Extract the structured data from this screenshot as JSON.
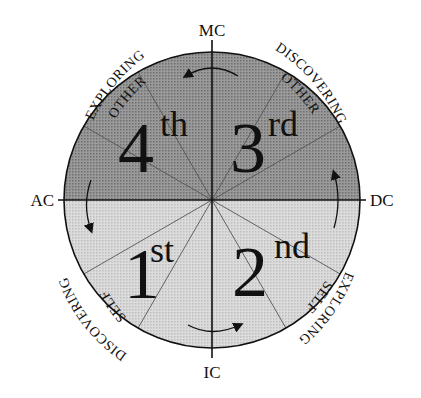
{
  "diagram": {
    "type": "quadrant-wheel",
    "center": {
      "x": 212,
      "y": 200
    },
    "radius": 148,
    "colors": {
      "upper_fill": "#8e8e8e",
      "lower_fill": "#d4d4d4",
      "lines": "#111111",
      "house_lines": "#555555"
    },
    "axis_labels": {
      "top": "MC",
      "bottom": "IC",
      "left": "AC",
      "right": "DC"
    },
    "quadrants": [
      {
        "number": "1",
        "suffix": "st",
        "position": "lower-left"
      },
      {
        "number": "2",
        "suffix": "nd",
        "position": "lower-right"
      },
      {
        "number": "3",
        "suffix": "rd",
        "position": "upper-right"
      },
      {
        "number": "4",
        "suffix": "th",
        "position": "upper-left"
      }
    ],
    "outer_labels": {
      "upper_left": {
        "line1": "EXPLORING",
        "line2": "OTHER"
      },
      "upper_right": {
        "line1": "DISCOVERING",
        "line2": "OTHER"
      },
      "lower_right": {
        "line1": "EXPLORING",
        "line2": "SELF"
      },
      "lower_left": {
        "line1": "DISCOVERING",
        "line2": "SELF"
      }
    },
    "houses_per_quadrant": 3,
    "arrows": [
      {
        "location": "top",
        "direction": "counter-clockwise"
      },
      {
        "location": "left",
        "direction": "counter-clockwise"
      },
      {
        "location": "bottom",
        "direction": "counter-clockwise"
      },
      {
        "location": "right",
        "direction": "counter-clockwise"
      }
    ]
  }
}
